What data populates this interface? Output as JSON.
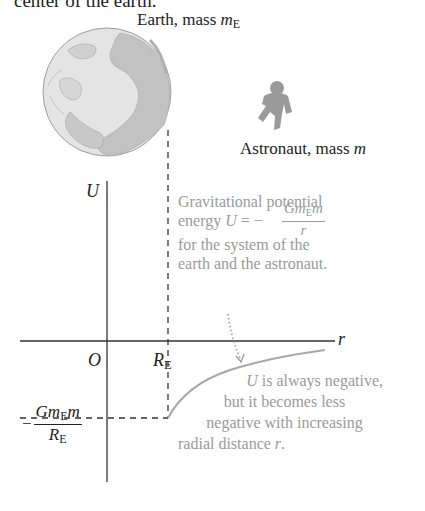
{
  "caption_fragment": "center of the earth.",
  "earth": {
    "label_prefix": "Earth, mass ",
    "label_var": "m",
    "label_sub": "E"
  },
  "astronaut": {
    "label_prefix": "Astronaut, mass ",
    "label_var": "m"
  },
  "axes": {
    "y_label": "U",
    "x_label": "r",
    "origin_label": "O",
    "radius_label_var": "R",
    "radius_label_sub": "E"
  },
  "min_value_label": {
    "sign": "−",
    "num_G": "Gm",
    "num_sub": "E",
    "num_m": "m",
    "den_var": "R",
    "den_sub": "E"
  },
  "annotation_top": {
    "line1": "Gravitational potential",
    "line2_prefix": "energy ",
    "line2_var": "U",
    "line2_eq": " = −",
    "frac_num_G": "Gm",
    "frac_num_sub": "E",
    "frac_num_m": "m",
    "frac_den": "r",
    "line3": "for the system of the",
    "line4": "earth and the astronaut."
  },
  "annotation_bottom": {
    "line1_var": "U",
    "line1_rest": " is always negative,",
    "line2": "but it becomes less",
    "line3": "negative with increasing",
    "line4_prefix": "radial distance ",
    "line4_var": "r",
    "line4_end": "."
  },
  "colors": {
    "ink": "#222222",
    "annotation": "#9a9a9a",
    "curve": "#a8a8a8",
    "earth_ocean": "#e6e6e6",
    "earth_land": "#bdbdbd"
  }
}
